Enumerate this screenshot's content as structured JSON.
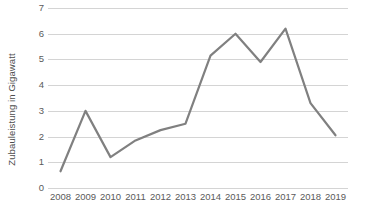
{
  "chart_data": {
    "type": "line",
    "title": "",
    "subtitle": "",
    "xlabel": "",
    "ylabel": "Zubauleistung in Gigawatt",
    "categories": [
      "2008",
      "2009",
      "2010",
      "2011",
      "2012",
      "2013",
      "2014",
      "2015",
      "2016",
      "2017",
      "2018",
      "2019"
    ],
    "values": [
      0.65,
      3.0,
      1.2,
      1.85,
      2.25,
      2.5,
      5.15,
      6.0,
      4.9,
      6.2,
      3.3,
      2.05
    ],
    "series": [
      {
        "name": "Zubauleistung",
        "values": [
          0.65,
          3.0,
          1.2,
          1.85,
          2.25,
          2.5,
          5.15,
          6.0,
          4.9,
          6.2,
          3.3,
          2.05
        ]
      }
    ],
    "ylim": [
      0,
      7
    ],
    "ytick_step": 1,
    "yticks": [
      "7",
      "6",
      "5",
      "4",
      "3",
      "2",
      "1",
      "0"
    ],
    "ytick_values": [
      7,
      6,
      5,
      4,
      3,
      2,
      1,
      0
    ],
    "grid": "horizontal",
    "legend": "none",
    "line_color": "#808080",
    "grid_color": "#d4d4d4",
    "text_color": "#5a5a5a",
    "background": "#ffffff",
    "markers": false,
    "line_width": 2.2
  }
}
